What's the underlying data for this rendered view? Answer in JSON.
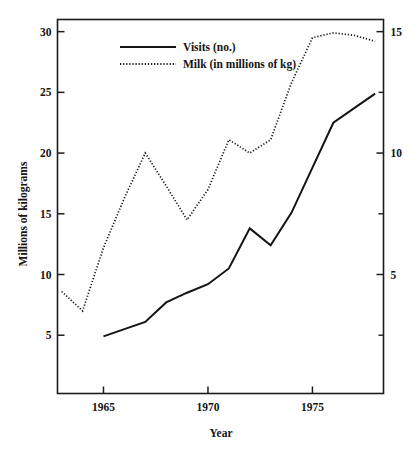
{
  "chart_data": {
    "type": "line",
    "title": "",
    "xlabel": "Year",
    "ylabel": "Millions of kilograms",
    "ylabel_right": "",
    "grid": false,
    "legend_position": "upper-left-inside",
    "xlim": [
      1962.8,
      1978.4
    ],
    "x_ticks": [
      1965,
      1970,
      1975
    ],
    "x_tick_labels": [
      "1965",
      "1970",
      "1975"
    ],
    "ylim_left": [
      0.2,
      31.0
    ],
    "y_ticks_left": [
      5,
      10,
      15,
      20,
      25,
      30
    ],
    "y_tick_labels_left": [
      "5",
      "10",
      "15",
      "20",
      "25",
      "30"
    ],
    "ylim_right": [
      0.1,
      15.5
    ],
    "y_ticks_right": [
      5,
      10,
      15
    ],
    "y_tick_labels_right": [
      "5",
      "10",
      "15"
    ],
    "y_minor_ticks_right": [
      2.5,
      7.5,
      12.5
    ],
    "series": [
      {
        "name": "Visits (no.)",
        "style": "solid",
        "axis": "right",
        "x": [
          1965,
          1966,
          1967,
          1968,
          1969,
          1970,
          1971,
          1972,
          1973,
          1974,
          1975,
          1976,
          1977,
          1978
        ],
        "values_left_scale": [
          5.0,
          5.6,
          6.2,
          7.8,
          8.6,
          9.4,
          10.7,
          14.0,
          12.6,
          15.3,
          19.0,
          22.7,
          23.9,
          25.1
        ],
        "values": [
          2.45,
          2.75,
          3.05,
          3.85,
          4.25,
          4.6,
          5.25,
          6.9,
          6.2,
          7.55,
          9.4,
          11.25,
          11.85,
          12.45
        ]
      },
      {
        "name": "Milk (in millions of kg)",
        "style": "dotted",
        "axis": "left",
        "x": [
          1963,
          1964,
          1965,
          1966,
          1967,
          1968,
          1969,
          1970,
          1971,
          1972,
          1973,
          1974,
          1975,
          1976,
          1977,
          1978
        ],
        "values": [
          8.6,
          7.0,
          12.2,
          16.3,
          20.0,
          17.3,
          14.5,
          17.0,
          21.1,
          20.0,
          21.1,
          25.8,
          29.5,
          29.9,
          29.7,
          29.2
        ]
      }
    ],
    "legend": [
      {
        "label": "Visits (no.)",
        "style": "solid"
      },
      {
        "label": "Milk (in millions of kg)",
        "style": "dotted"
      }
    ]
  }
}
